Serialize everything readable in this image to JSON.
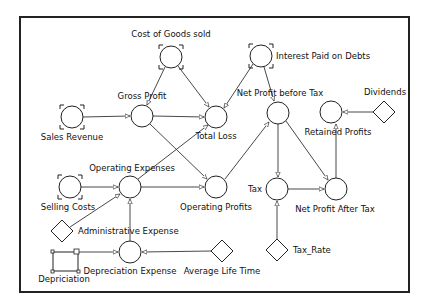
{
  "diagram": {
    "nodes": {
      "cost_of_goods_sold": {
        "label": "Cost of Goods sold",
        "type": "input-converter"
      },
      "interest_paid_on_debts": {
        "label": "Interest Paid on Debts",
        "type": "input-converter"
      },
      "sales_revenue": {
        "label": "Sales Revenue",
        "type": "input-converter"
      },
      "gross_profit": {
        "label": "Gross Profit",
        "type": "converter"
      },
      "total_loss": {
        "label": "Total Loss",
        "type": "converter"
      },
      "net_profit_before_tax": {
        "label": "Net Profit before Tax",
        "type": "converter"
      },
      "retained_profits": {
        "label": "Retained Profits",
        "type": "converter"
      },
      "dividends": {
        "label": "Dividends",
        "type": "constant"
      },
      "selling_costs": {
        "label": "Selling Costs",
        "type": "input-converter"
      },
      "operating_expenses": {
        "label": "Operating Expenses",
        "type": "converter"
      },
      "operating_profits": {
        "label": "Operating Profits",
        "type": "converter"
      },
      "tax": {
        "label": "Tax",
        "type": "converter"
      },
      "net_profit_after_tax": {
        "label": "Net Profit After Tax",
        "type": "converter"
      },
      "administrative_expense": {
        "label": "Administrative Expense",
        "type": "constant"
      },
      "depriciation": {
        "label": "Depriciation",
        "type": "stock"
      },
      "depreciation_expense": {
        "label": "Depreciation Expense",
        "type": "converter"
      },
      "average_life_time": {
        "label": "Average Life Time",
        "type": "constant"
      },
      "tax_rate": {
        "label": "Tax_Rate",
        "type": "constant"
      }
    },
    "edges": [
      {
        "from": "sales_revenue",
        "to": "gross_profit"
      },
      {
        "from": "cost_of_goods_sold",
        "to": "gross_profit"
      },
      {
        "from": "cost_of_goods_sold",
        "to": "total_loss"
      },
      {
        "from": "gross_profit",
        "to": "total_loss"
      },
      {
        "from": "gross_profit",
        "to": "operating_profits"
      },
      {
        "from": "interest_paid_on_debts",
        "to": "total_loss"
      },
      {
        "from": "interest_paid_on_debts",
        "to": "net_profit_before_tax"
      },
      {
        "from": "operating_expenses",
        "to": "total_loss"
      },
      {
        "from": "operating_expenses",
        "to": "operating_profits"
      },
      {
        "from": "selling_costs",
        "to": "operating_expenses"
      },
      {
        "from": "administrative_expense",
        "to": "operating_expenses"
      },
      {
        "from": "depreciation_expense",
        "to": "operating_expenses"
      },
      {
        "from": "depriciation",
        "to": "depreciation_expense"
      },
      {
        "from": "average_life_time",
        "to": "depreciation_expense"
      },
      {
        "from": "operating_profits",
        "to": "net_profit_before_tax"
      },
      {
        "from": "net_profit_before_tax",
        "to": "tax"
      },
      {
        "from": "net_profit_before_tax",
        "to": "net_profit_after_tax"
      },
      {
        "from": "tax",
        "to": "net_profit_after_tax"
      },
      {
        "from": "tax_rate",
        "to": "tax"
      },
      {
        "from": "net_profit_after_tax",
        "to": "retained_profits"
      },
      {
        "from": "dividends",
        "to": "retained_profits"
      }
    ]
  }
}
